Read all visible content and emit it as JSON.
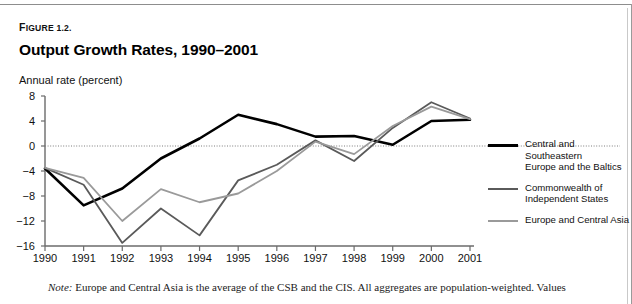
{
  "figure": {
    "label_prefix": "F",
    "label": "IGURE 1.2.",
    "title": "Output Growth Rates, 1990–2001",
    "axis_caption": "Annual rate (percent)",
    "note_label": "Note:",
    "note_text": " Europe and Central Asia is the average of the CSB and the CIS. All aggregates are population-weighted. Values"
  },
  "colors": {
    "csb": "#000000",
    "cis": "#5a5a5a",
    "eca": "#9a9a9a",
    "axis": "#6b6b6b",
    "zero_line": "#7d7d7d"
  },
  "legend": {
    "position": "right",
    "items": [
      {
        "label": "Central and Southeastern Europe and the Baltics",
        "line1": "Central and Southeastern",
        "line2": "Europe and the Baltics",
        "color": "#000000",
        "width": 2.6
      },
      {
        "label": "Commonwealth of Independent States",
        "line1": "Commonwealth of",
        "line2": "Independent States",
        "color": "#5a5a5a",
        "width": 1.8
      },
      {
        "label": "Europe and Central Asia",
        "line1": "Europe and Central Asia",
        "line2": "",
        "color": "#9a9a9a",
        "width": 1.8
      }
    ]
  },
  "chart_data": {
    "type": "line",
    "title": "Output Growth Rates, 1990–2001",
    "xlabel": "",
    "ylabel": "Annual rate (percent)",
    "x": [
      1990,
      1991,
      1992,
      1993,
      1994,
      1995,
      1996,
      1997,
      1998,
      1999,
      2000,
      2001
    ],
    "categories": [
      "1990",
      "1991",
      "1992",
      "1993",
      "1994",
      "1995",
      "1996",
      "1997",
      "1998",
      "1999",
      "2000",
      "2001"
    ],
    "xlim": [
      1990,
      2001
    ],
    "ylim": [
      -16,
      8
    ],
    "yticks": [
      8,
      4,
      0,
      -4,
      -8,
      -12,
      -16
    ],
    "xticks": [
      "1990",
      "1991",
      "1992",
      "1993",
      "1994",
      "1995",
      "1996",
      "1997",
      "1998",
      "1999",
      "2000",
      "2001"
    ],
    "grid": false,
    "zero_line": true,
    "series": [
      {
        "name": "Central and Southeastern Europe and the Baltics",
        "color": "#000000",
        "values": [
          -3.6,
          -9.5,
          -6.8,
          -2.0,
          1.2,
          5.0,
          3.5,
          1.5,
          1.6,
          0.2,
          4.0,
          4.2
        ]
      },
      {
        "name": "Commonwealth of Independent States",
        "color": "#5a5a5a",
        "values": [
          -3.5,
          -6.2,
          -15.5,
          -10.0,
          -14.3,
          -5.5,
          -3.0,
          0.9,
          -2.4,
          2.9,
          7.0,
          4.4
        ]
      },
      {
        "name": "Europe and Central Asia",
        "color": "#9a9a9a",
        "values": [
          -3.5,
          -5.1,
          -12.0,
          -6.9,
          -9.0,
          -7.6,
          -4.0,
          0.7,
          -1.3,
          3.2,
          6.3,
          4.3
        ]
      }
    ]
  }
}
